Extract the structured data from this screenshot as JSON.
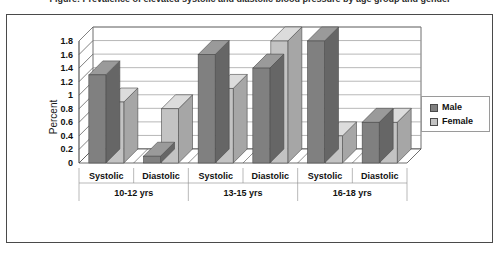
{
  "caption": {
    "text": "Figure: Prevalence of elevated systolic and diastolic blood pressure by age group and gender"
  },
  "chart_data": {
    "type": "bar",
    "title": "",
    "xlabel": "",
    "ylabel": "Percent",
    "ylim": [
      0,
      1.8
    ],
    "ytick_step": 0.2,
    "yticks": [
      "0",
      "0.2",
      "0.4",
      "0.6",
      "0.8",
      "1",
      "1.2",
      "1.4",
      "1.6",
      "1.8"
    ],
    "grid": true,
    "style": "3d-clustered-column",
    "legend_position": "right",
    "categories": [
      "Systolic",
      "Diastolic",
      "Systolic",
      "Diastolic",
      "Systolic",
      "Diastolic"
    ],
    "groups": [
      {
        "label": "10-12 yrs",
        "categories": [
          "Systolic",
          "Diastolic"
        ]
      },
      {
        "label": "13-15 yrs",
        "categories": [
          "Systolic",
          "Diastolic"
        ]
      },
      {
        "label": "16-18 yrs",
        "categories": [
          "Systolic",
          "Diastolic"
        ]
      }
    ],
    "series": [
      {
        "name": "Male",
        "color": "#808080",
        "values": [
          1.3,
          0.1,
          1.6,
          1.4,
          1.8,
          0.6
        ]
      },
      {
        "name": "Female",
        "color": "#c3c3c3",
        "values": [
          0.9,
          0.8,
          1.1,
          1.8,
          0.4,
          0.6
        ]
      }
    ],
    "colors": {
      "male": "#808080",
      "female": "#c3c3c3",
      "male_top": "#9a9a9a",
      "female_top": "#dcdcdc",
      "male_side": "#666666",
      "female_side": "#a6a6a6",
      "grid": "#999999",
      "axis": "#4a4a4a",
      "frame": "#4a4a4a",
      "plot_bg": "#ffffff"
    }
  },
  "legend": {
    "items": [
      {
        "label": "Male",
        "color": "#808080"
      },
      {
        "label": "Female",
        "color": "#c3c3c3"
      }
    ]
  }
}
